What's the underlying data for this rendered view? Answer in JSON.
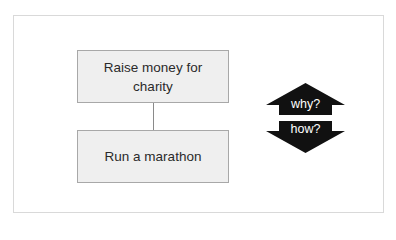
{
  "diagram": {
    "boxes": [
      {
        "id": "top",
        "label": "Raise money for charity"
      },
      {
        "id": "bottom",
        "label": "Run a marathon"
      }
    ],
    "connector": {
      "from": "top",
      "to": "bottom"
    },
    "arrows": {
      "up_label": "why?",
      "down_label": "how?",
      "fill_color": "#111111"
    },
    "colors": {
      "box_fill": "#efefef",
      "box_border": "#a8a8a8",
      "frame_border": "#d9d9d9"
    }
  }
}
